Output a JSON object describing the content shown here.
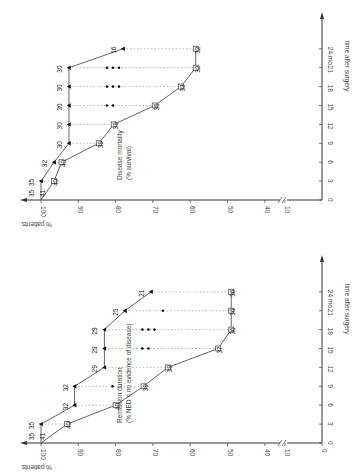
{
  "chart_data": [
    {
      "type": "line",
      "orientation": "rotated 90° counter-clockwise",
      "title": "Disease mortality (% survival)",
      "xlabel": "time after surgery",
      "ylabel": "% patients",
      "x_ticks": [
        "0",
        "3",
        "6",
        "9",
        "12",
        "15",
        "18",
        "21",
        "24 mo."
      ],
      "y_ticks": [
        "100",
        "90",
        "80",
        "70",
        "60",
        "50",
        "40",
        "10"
      ],
      "axis_break": "between 40 and 10",
      "x": [
        0,
        3,
        6,
        9,
        12,
        15,
        18,
        21,
        24
      ],
      "series": [
        {
          "name": "filled-triangle",
          "marker": "filled",
          "values": [
            100,
            100,
            96.5,
            92.5,
            92.5,
            92.5,
            92.5,
            92.5,
            78
          ],
          "labels": [
            "35",
            "35",
            "32",
            "30",
            "30",
            "30",
            "30",
            "30",
            "16"
          ]
        },
        {
          "name": "open-square",
          "marker": "open",
          "values": [
            100,
            96.5,
            94.5,
            84.5,
            80.5,
            69.5,
            62.5,
            58.5,
            58.5
          ],
          "labels": [
            "41",
            "40",
            "40",
            "39",
            "39",
            "35",
            "33",
            "32",
            "32"
          ]
        }
      ],
      "censor_dots": {
        "15": 2,
        "18": 3,
        "21": 3
      }
    },
    {
      "type": "line",
      "orientation": "rotated 90° counter-clockwise",
      "title": "Remission duration (% NED = no evidence of disease)",
      "xlabel": "time after surgery",
      "ylabel": "% patients",
      "x_ticks": [
        "0",
        "3",
        "6",
        "9",
        "12",
        "15",
        "18",
        "21",
        "24 mo."
      ],
      "y_ticks": [
        "100",
        "90",
        "80",
        "70",
        "60",
        "50",
        "40",
        "10",
        "0"
      ],
      "axis_break": "between 40 and 10",
      "x": [
        0,
        3,
        6,
        9,
        12,
        15,
        18,
        21,
        24
      ],
      "series": [
        {
          "name": "filled-triangle",
          "marker": "filled",
          "values": [
            100,
            100,
            91,
            91,
            83,
            83,
            83,
            77.5,
            70.5
          ],
          "labels": [
            "35",
            "35",
            "32",
            "32",
            "29",
            "29",
            "29",
            "25",
            "21"
          ]
        },
        {
          "name": "open-square",
          "marker": "open",
          "values": [
            100,
            93,
            80,
            72.5,
            66,
            52.5,
            49,
            49,
            49
          ],
          "labels": [
            "41",
            "40",
            "40",
            "39",
            "39",
            "37",
            "36",
            "36",
            "36"
          ]
        }
      ],
      "censor_dots": {
        "9": 1,
        "15": 2,
        "18": 3,
        "21": 1
      }
    }
  ],
  "charts": {
    "top": {
      "title_line1": "Disease mortality",
      "title_line2": "(% survival)",
      "ylabel": "% patients",
      "xlabel": "time after surgery"
    },
    "bottom": {
      "title_line1": "Remission duration",
      "title_line2": "(% NED = no evidence of disease)",
      "ylabel": "% patients",
      "xlabel": "time after surgery"
    }
  }
}
